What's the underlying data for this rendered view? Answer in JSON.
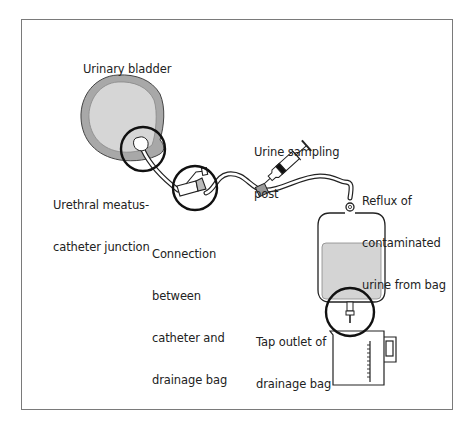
{
  "diagram": {
    "labels": {
      "bladder": [
        "Urinary bladder"
      ],
      "meatus_junction": [
        "Urethral meatus-",
        "catheter junction"
      ],
      "connection": [
        "Connection",
        "between",
        "catheter and",
        "drainage bag"
      ],
      "sampling_post": [
        "Urine sampling",
        "post"
      ],
      "reflux": [
        "Reflux of",
        "contaminated",
        "urine from bag"
      ],
      "tap_outlet": [
        "Tap outlet of",
        "drainage bag"
      ]
    },
    "colors": {
      "bladder_outer": "#a8a8a8",
      "bladder_inner": "#d6d6d6",
      "urine": "#d4d4d4",
      "outline": "#111111",
      "frame": "#7a7a7a"
    }
  }
}
